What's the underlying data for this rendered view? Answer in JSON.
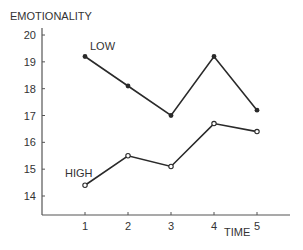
{
  "chart_data": {
    "type": "line",
    "title": "",
    "xlabel": "TIME",
    "ylabel": "EMOTIONALITY",
    "x": [
      1,
      2,
      3,
      4,
      5
    ],
    "x_ticks": [
      "1",
      "2",
      "3",
      "4",
      "5"
    ],
    "y_ticks": [
      "14",
      "15",
      "16",
      "17",
      "18",
      "19",
      "20"
    ],
    "ylim": [
      13.3,
      20.2
    ],
    "xlim": [
      0,
      5.7
    ],
    "grid": false,
    "legend": "inline labels",
    "series": [
      {
        "name": "LOW",
        "marker": "filled-circle",
        "values": [
          19.2,
          18.1,
          17.0,
          19.2,
          17.2
        ]
      },
      {
        "name": "HIGH",
        "marker": "open-circle",
        "values": [
          14.4,
          15.5,
          15.1,
          16.7,
          16.4
        ]
      }
    ]
  },
  "colors": {
    "line": "#2a2a2a",
    "axis": "#555555",
    "text": "#333333"
  }
}
